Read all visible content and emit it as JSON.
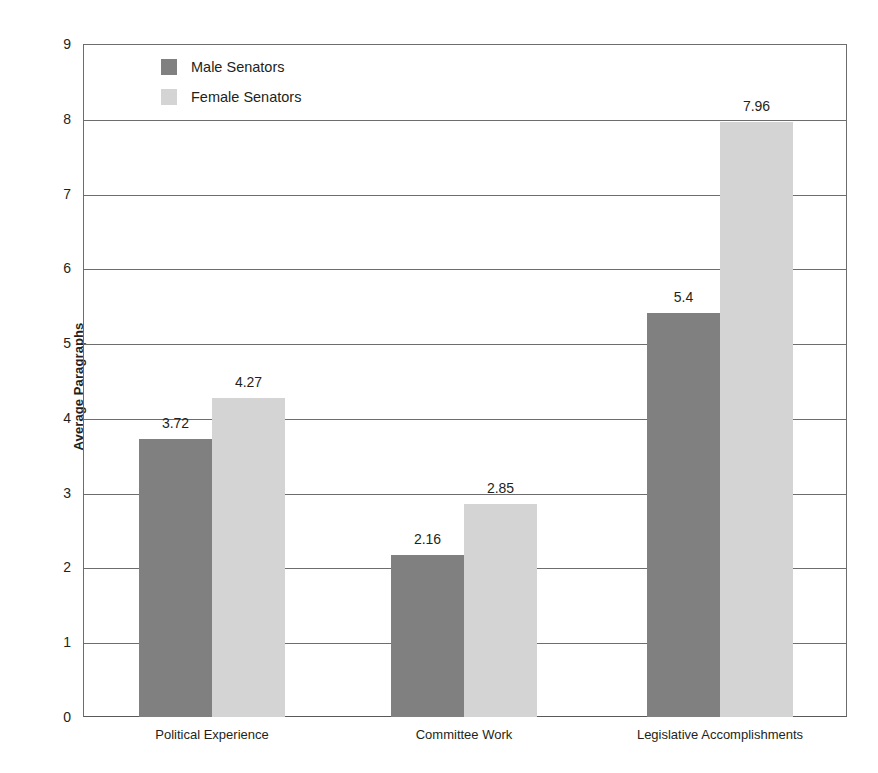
{
  "chart_data": {
    "type": "bar",
    "title": "",
    "xlabel": "",
    "ylabel": "Average Paragraphs",
    "categories": [
      "Political Experience",
      "Committee Work",
      "Legislative Accomplishments"
    ],
    "series": [
      {
        "name": "Male Senators",
        "color": "#808080",
        "values": [
          3.72,
          2.16,
          5.4
        ],
        "value_labels": [
          "3.72",
          "2.16",
          "5.4"
        ]
      },
      {
        "name": "Female Senators",
        "color": "#d4d4d4",
        "values": [
          4.27,
          2.85,
          7.96
        ],
        "value_labels": [
          "4.27",
          "2.85",
          "7.96"
        ]
      }
    ],
    "ylim": [
      0,
      9
    ],
    "yticks": [
      0,
      1,
      2,
      3,
      4,
      5,
      6,
      7,
      8,
      9
    ],
    "ytick_labels": [
      "0",
      "1",
      "2",
      "3",
      "4",
      "5",
      "6",
      "7",
      "8",
      "9"
    ],
    "grid": "horizontal",
    "legend_position": "top-left-inside",
    "axis_color": "#6d6d6d",
    "text_color": "#231f20",
    "background": "#ffffff"
  },
  "legend": {
    "items": [
      {
        "label": "Male Senators"
      },
      {
        "label": "Female Senators"
      }
    ]
  }
}
